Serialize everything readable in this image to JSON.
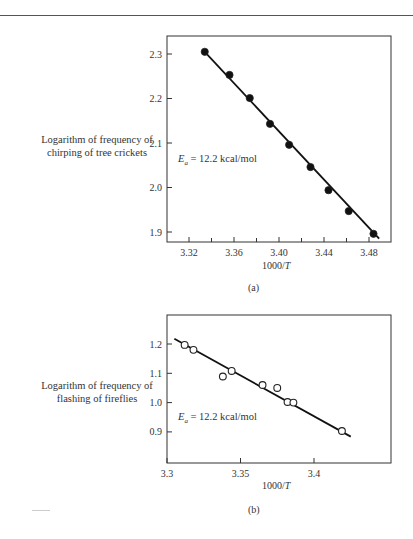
{
  "figure": {
    "panel_a": {
      "ylabel_line1": "Logarithm of frequency of",
      "ylabel_line2": "chirping of tree crickets",
      "xlabel_prefix": "1000/",
      "xlabel_var": "T",
      "annotation": "E_a = 12.2 kcal/mol",
      "annotation_sym": "E",
      "annotation_sub": "a",
      "annotation_rest": " = 12.2 kcal/mol",
      "label": "(a)"
    },
    "panel_b": {
      "ylabel_line1": "Logarithm of frequency of",
      "ylabel_line2": "flashing of fireflies",
      "xlabel_prefix": "1000/",
      "xlabel_var": "T",
      "annotation": "E_a = 12.2 kcal/mol",
      "annotation_sym": "E",
      "annotation_sub": "a",
      "annotation_rest": " = 12.2 kcal/mol",
      "label": "(b)"
    }
  },
  "chart_data": [
    {
      "type": "scatter",
      "title": "",
      "panel": "(a)",
      "xlabel": "1000/T",
      "ylabel": "Logarithm of frequency of chirping of tree crickets",
      "xlim": [
        3.3,
        3.495
      ],
      "ylim": [
        1.88,
        2.34
      ],
      "xticks": [
        3.32,
        3.36,
        3.4,
        3.44,
        3.48
      ],
      "xtick_labels": [
        "3.32",
        "3.36",
        "3.40",
        "3.44",
        "3.48"
      ],
      "xminor_ticks": [
        3.34,
        3.38,
        3.42,
        3.46
      ],
      "yticks": [
        1.9,
        2.0,
        2.1,
        2.2,
        2.3
      ],
      "ytick_labels": [
        "1.9",
        "2.0",
        "2.1",
        "2.2",
        "2.3"
      ],
      "grid": false,
      "marker": "filled-circle",
      "series": [
        {
          "name": "tree crickets",
          "x": [
            3.334,
            3.356,
            3.374,
            3.392,
            3.409,
            3.428,
            3.444,
            3.462,
            3.484
          ],
          "y": [
            2.305,
            2.253,
            2.201,
            2.143,
            2.096,
            2.046,
            1.994,
            1.947,
            1.896
          ]
        }
      ],
      "fit_line": {
        "x": [
          3.334,
          3.489
        ],
        "y": [
          2.305,
          1.885
        ]
      },
      "annotations": [
        "E_a = 12.2 kcal/mol"
      ]
    },
    {
      "type": "scatter",
      "title": "",
      "panel": "(b)",
      "xlabel": "1000/T",
      "ylabel": "Logarithm of frequency of flashing of fireflies",
      "xlim": [
        3.3,
        3.452
      ],
      "ylim": [
        0.8,
        1.3
      ],
      "xticks": [
        3.3,
        3.35,
        3.4
      ],
      "xtick_labels": [
        "3.3",
        "3.35",
        "3.4"
      ],
      "yticks": [
        0.9,
        1.0,
        1.1,
        1.2
      ],
      "ytick_labels": [
        "0.9",
        "1.0",
        "1.1",
        "1.2"
      ],
      "grid": false,
      "marker": "open-circle",
      "series": [
        {
          "name": "fireflies",
          "x": [
            3.312,
            3.318,
            3.338,
            3.344,
            3.365,
            3.375,
            3.382,
            3.386,
            3.419
          ],
          "y": [
            1.197,
            1.18,
            1.089,
            1.108,
            1.06,
            1.05,
            1.002,
            1.0,
            0.903
          ]
        }
      ],
      "fit_line": {
        "x": [
          3.305,
          3.425
        ],
        "y": [
          1.218,
          0.884
        ]
      },
      "annotations": [
        "E_a = 12.2 kcal/mol"
      ]
    }
  ]
}
